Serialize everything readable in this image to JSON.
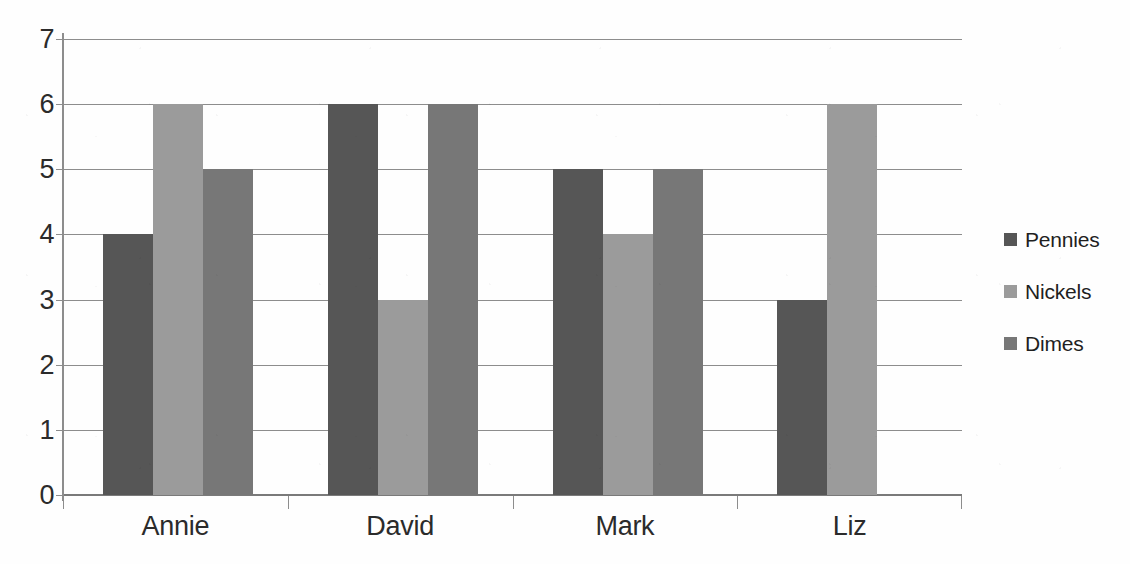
{
  "figure": {
    "title_partial": "",
    "background_color": "#ffffff"
  },
  "legend": {
    "position": "right",
    "items": [
      {
        "label": "Pennies",
        "color": "#565656",
        "swatch_name": "legend-swatch-pennies"
      },
      {
        "label": "Nickels",
        "color": "#9b9b9b",
        "swatch_name": "legend-swatch-nickels"
      },
      {
        "label": "Dimes",
        "color": "#777777",
        "swatch_name": "legend-swatch-dimes"
      }
    ]
  },
  "axes": {
    "y_ticks": [
      "7",
      "6",
      "5",
      "4",
      "3",
      "2",
      "1",
      "0"
    ],
    "x_ticks": [
      "Annie",
      "David",
      "Mark",
      "Liz"
    ]
  },
  "chart_data": {
    "type": "bar",
    "title": "",
    "subtitle": "",
    "xlabel": "",
    "ylabel": "",
    "categories": [
      "Annie",
      "David",
      "Mark",
      "Liz"
    ],
    "series": [
      {
        "name": "Pennies",
        "color": "#565656",
        "values": [
          4,
          6,
          5,
          3
        ]
      },
      {
        "name": "Nickels",
        "color": "#9b9b9b",
        "values": [
          6,
          3,
          4,
          6
        ]
      },
      {
        "name": "Dimes",
        "color": "#777777",
        "values": [
          5,
          6,
          5,
          0
        ]
      }
    ],
    "ylim": [
      0,
      7
    ],
    "ytick_step": 1,
    "ytick_labels": [
      "0",
      "1",
      "2",
      "3",
      "4",
      "5",
      "6",
      "7"
    ],
    "grid": true,
    "grid_axis": "y",
    "legend_position": "right",
    "orientation": "vertical",
    "grouping": "clustered",
    "style": "grayscale"
  }
}
